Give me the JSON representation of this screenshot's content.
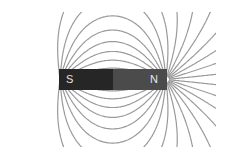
{
  "diagram": {
    "magnet": {
      "south_label": "S",
      "north_label": "N",
      "south_color": "#262626",
      "north_color": "#4b4b4b"
    },
    "field_line_color": "#9a9a9a",
    "background": "#ffffff"
  }
}
